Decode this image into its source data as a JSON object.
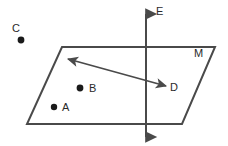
{
  "figure": {
    "type": "geometry-diagram",
    "background_color": "#ffffff",
    "stroke_color": "#4a4a4a",
    "point_color": "#1a1a1a",
    "label_color": "#2a2a2a",
    "plane": {
      "name": "M",
      "label": "M",
      "label_x": 194,
      "label_y": 48,
      "vertices": [
        {
          "x": 62,
          "y": 47
        },
        {
          "x": 215,
          "y": 47
        },
        {
          "x": 182,
          "y": 124
        },
        {
          "x": 27,
          "y": 124
        }
      ]
    },
    "points": [
      {
        "id": "A",
        "label": "A",
        "cx": 54,
        "cy": 107,
        "r": 3.2,
        "label_x": 62,
        "label_y": 102
      },
      {
        "id": "B",
        "label": "B",
        "cx": 80,
        "cy": 88,
        "r": 3.4,
        "label_x": 89,
        "label_y": 83
      },
      {
        "id": "C",
        "label": "C",
        "cx": 21,
        "cy": 40,
        "r": 3.4,
        "label_x": 12,
        "label_y": 23
      }
    ],
    "line_e": {
      "label": "E",
      "label_x": 156,
      "label_y": 6,
      "x": 146,
      "y_top": 14,
      "y_bottom": 137,
      "arrowheads": "both"
    },
    "arrow_d": {
      "label": "D",
      "label_x": 170,
      "label_y": 82,
      "x1": 68,
      "y1": 59,
      "x2": 166,
      "y2": 86,
      "arrowheads": "both"
    }
  }
}
